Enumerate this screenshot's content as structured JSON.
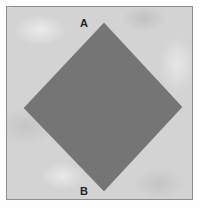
{
  "figure": {
    "title": "",
    "canvas": {
      "width": 200,
      "height": 208
    },
    "frame": {
      "border_color": "#8d8d8d",
      "background_color": "#d3d3d3",
      "texture": "mottled-paper-grain"
    },
    "shape": {
      "name": "diamond",
      "kind": "square-rotated-45",
      "fill_color": "#757575",
      "stroke_color": "#6e6e6e",
      "vertices": [
        {
          "label": "A",
          "x": 103,
          "y": 22
        },
        {
          "label": "",
          "x": 181,
          "y": 106
        },
        {
          "label": "B",
          "x": 103,
          "y": 190
        },
        {
          "label": "",
          "x": 23,
          "y": 107
        }
      ]
    },
    "labels": [
      {
        "id": "a",
        "text": "A",
        "x": 78,
        "y": 17,
        "color": "#242424"
      },
      {
        "id": "b",
        "text": "B",
        "x": 78,
        "y": 185,
        "color": "#242424"
      }
    ]
  }
}
